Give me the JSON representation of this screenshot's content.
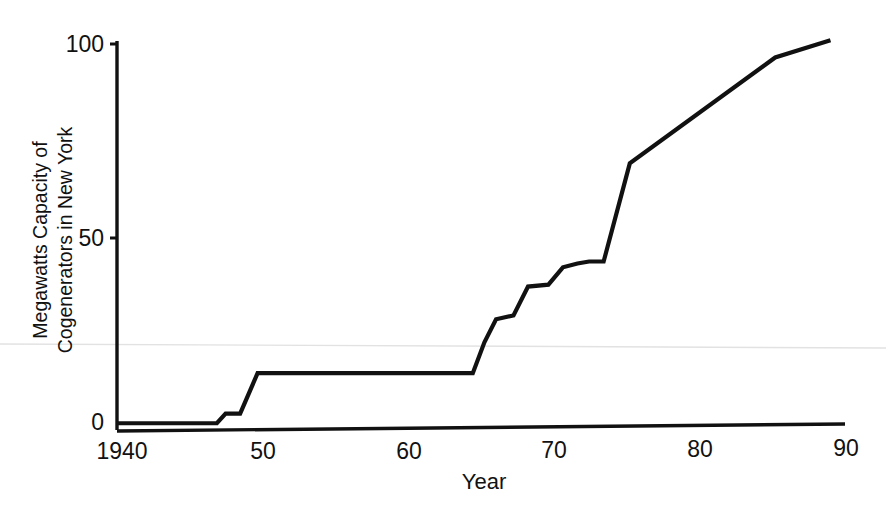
{
  "chart_data": {
    "type": "line",
    "title": "",
    "xlabel": "Year",
    "ylabel": "Megawatts Capacity of Cogenerators in New York",
    "ylabel_line1": "Megawatts Capacity of",
    "ylabel_line2": "Cogenerators in New York",
    "xlim": [
      1940,
      1990
    ],
    "ylim": [
      0,
      107
    ],
    "grid": false,
    "legend": null,
    "x_tick_labels": [
      "1940",
      "50",
      "60",
      "70",
      "80",
      "90"
    ],
    "x_tick_values": [
      1940,
      1950,
      1960,
      1970,
      1980,
      1990
    ],
    "y_tick_labels": [
      "0",
      "50",
      "100"
    ],
    "y_tick_values": [
      0,
      50,
      100
    ],
    "series": [
      {
        "name": "Megawatts Capacity of Cogenerators in New York",
        "color": "#111111",
        "x": [
          1940,
          1946.8,
          1947.4,
          1948.4,
          1949.6,
          1964.4,
          1965.2,
          1966.0,
          1967.2,
          1968.2,
          1969.6,
          1970.6,
          1971.6,
          1972.4,
          1973.4,
          1975.2,
          1985.2,
          1989.0
        ],
        "values": [
          1.5,
          1.5,
          4.0,
          4.0,
          14.5,
          14.5,
          22.5,
          28.5,
          29.5,
          37.0,
          37.5,
          42.0,
          43.0,
          43.5,
          43.5,
          69.0,
          96.5,
          101.0
        ]
      }
    ]
  }
}
